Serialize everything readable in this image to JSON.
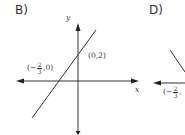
{
  "options": [
    {
      "label": "B)",
      "axes": {
        "x_label": "x",
        "y_label": "y"
      },
      "points": [
        {
          "label_open": "(",
          "coord_x": "0",
          "sep": ",",
          "coord_y": "2",
          "label_close": ")"
        },
        {
          "label_open": "(",
          "sign": "−",
          "num": "2",
          "den": "3",
          "sep": ",",
          "coord_y": "0",
          "label_close": ")"
        }
      ],
      "line": {
        "slope_direction": "positive",
        "y_intercept": "(0,2)",
        "x_intercept": "(-2/3,0)"
      }
    },
    {
      "label": "D)",
      "points": [
        {
          "label_open": "(",
          "sign": "−",
          "num": "2",
          "den": "3",
          "sep": ","
        }
      ],
      "line": {
        "slope_direction": "negative"
      }
    }
  ],
  "colors": {
    "ink": "#222222",
    "background": "#ffffff"
  }
}
